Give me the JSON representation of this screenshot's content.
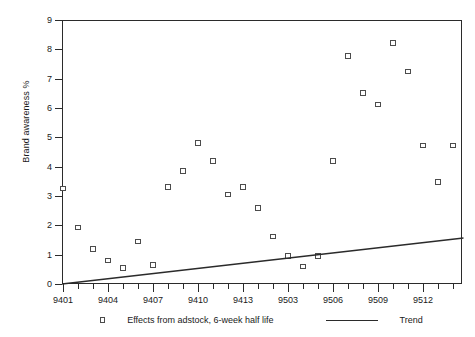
{
  "chart_data": {
    "type": "scatter",
    "title": "",
    "xlabel": "",
    "ylabel": "Brand awareness %",
    "ylim": [
      0,
      9
    ],
    "yticks": [
      0,
      1,
      2,
      3,
      4,
      5,
      6,
      7,
      8,
      9
    ],
    "ytick_labels": [
      "0",
      "1",
      "2",
      "3",
      "4",
      "5",
      "6",
      "7",
      "8",
      "9"
    ],
    "xtick_labels": [
      "9401",
      "9404",
      "9407",
      "9410",
      "9413",
      "9503",
      "9506",
      "9509",
      "9512"
    ],
    "xtick_values": [
      9401,
      9404,
      9407,
      9410,
      9413,
      9503,
      9506,
      9509,
      9512
    ],
    "x_period_count": 27,
    "x_minor_ticks_between_majors": 2,
    "grid": false,
    "legend_position": "below-axes",
    "legend": [
      {
        "label": "Effects from adstock, 6-week half life",
        "marker": "open-square",
        "type": "scatter",
        "color": "#4c4c4c"
      },
      {
        "label": "Trend",
        "marker": "line",
        "type": "line",
        "color": "#2b2b2b"
      }
    ],
    "series": [
      {
        "name": "Effects from adstock, 6-week half life",
        "marker": "open-square",
        "color": "#4c4c4c",
        "points": [
          {
            "x": 9401,
            "xi": 0,
            "y": 3.25
          },
          {
            "x": 9402,
            "xi": 1,
            "y": 1.92
          },
          {
            "x": 9403,
            "xi": 2,
            "y": 1.2
          },
          {
            "x": 9404,
            "xi": 3,
            "y": 0.8
          },
          {
            "x": 9405,
            "xi": 4,
            "y": 0.55
          },
          {
            "x": 9406,
            "xi": 5,
            "y": 1.45
          },
          {
            "x": 9407,
            "xi": 6,
            "y": 0.65
          },
          {
            "x": 9408,
            "xi": 7,
            "y": 3.3
          },
          {
            "x": 9409,
            "xi": 8,
            "y": 3.85
          },
          {
            "x": 9410,
            "xi": 9,
            "y": 4.8
          },
          {
            "x": 9411,
            "xi": 10,
            "y": 4.2
          },
          {
            "x": 9412,
            "xi": 11,
            "y": 3.05
          },
          {
            "x": 9413,
            "xi": 12,
            "y": 3.3
          },
          {
            "x": 9501,
            "xi": 13,
            "y": 2.6
          },
          {
            "x": 9502,
            "xi": 14,
            "y": 1.62
          },
          {
            "x": 9503,
            "xi": 15,
            "y": 0.95
          },
          {
            "x": 9504,
            "xi": 16,
            "y": 0.6
          },
          {
            "x": 9505,
            "xi": 17,
            "y": 0.95
          },
          {
            "x": 9506,
            "xi": 18,
            "y": 4.2
          },
          {
            "x": 9507,
            "xi": 19,
            "y": 7.78
          },
          {
            "x": 9508,
            "xi": 20,
            "y": 6.52
          },
          {
            "x": 9509,
            "xi": 21,
            "y": 6.12
          },
          {
            "x": 9510,
            "xi": 22,
            "y": 8.22
          },
          {
            "x": 9511,
            "xi": 23,
            "y": 7.24
          },
          {
            "x": 9512,
            "xi": 24,
            "y": 4.72
          },
          {
            "x": 9513,
            "xi": 25,
            "y": 3.48
          },
          {
            "x": 9514,
            "xi": 26,
            "y": 4.72
          }
        ]
      },
      {
        "name": "Trend",
        "marker": "line",
        "color": "#2b2b2b",
        "line": {
          "x_start_index": 0,
          "y_start": 0.0,
          "x_end_index": 26.7,
          "y_end": 1.57
        }
      }
    ]
  }
}
